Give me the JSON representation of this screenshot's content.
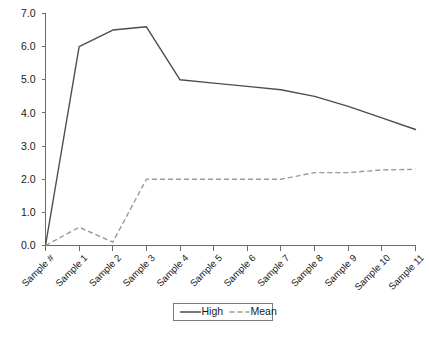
{
  "chart_data": {
    "type": "line",
    "title": "",
    "xlabel": "",
    "ylabel": "",
    "grid": false,
    "legend_position": "bottom",
    "categories": [
      "Sample #",
      "Sample 1",
      "Sample 2",
      "Sample 3",
      "Sample 4",
      "Sample 5",
      "Sample 6",
      "Sample 7",
      "Sample 8",
      "Sample 9",
      "Sample 10",
      "Sample 11"
    ],
    "ylim": [
      0.0,
      7.0
    ],
    "ytick_labels": [
      "0.0",
      "1.0",
      "2.0",
      "3.0",
      "4.0",
      "5.0",
      "6.0",
      "7.0"
    ],
    "ytick_values": [
      0.0,
      1.0,
      2.0,
      3.0,
      4.0,
      5.0,
      6.0,
      7.0
    ],
    "series": [
      {
        "name": "High",
        "style": "solid",
        "color": "#4d4d4d",
        "values": [
          0.0,
          6.0,
          6.5,
          6.6,
          5.0,
          4.9,
          4.8,
          4.7,
          4.5,
          4.2,
          3.85,
          3.5
        ]
      },
      {
        "name": "Mean",
        "style": "dashed",
        "color": "#9a9a9a",
        "values": [
          0.0,
          0.55,
          0.1,
          2.0,
          2.0,
          2.0,
          2.0,
          2.0,
          2.2,
          2.2,
          2.28,
          2.3
        ]
      }
    ]
  },
  "legend": {
    "entries": [
      {
        "label": "High"
      },
      {
        "label": "Mean"
      }
    ]
  },
  "caption": {
    "ghost_text": ""
  }
}
